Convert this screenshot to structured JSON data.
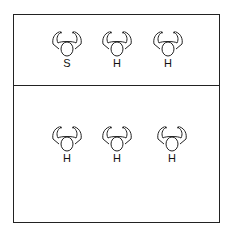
{
  "diagram": {
    "top_section": {
      "persons": [
        {
          "label": "S"
        },
        {
          "label": "H"
        },
        {
          "label": "H"
        }
      ]
    },
    "bottom_section": {
      "persons": [
        {
          "label": "H"
        },
        {
          "label": "H"
        },
        {
          "label": "H"
        }
      ]
    },
    "colors": {
      "line": "#222222",
      "background": "#ffffff"
    }
  }
}
